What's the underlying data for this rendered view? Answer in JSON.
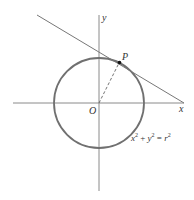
{
  "diagram": {
    "type": "geometry",
    "axes": {
      "x_label": "x",
      "y_label": "y",
      "origin_label": "O"
    },
    "point": {
      "label": "P"
    },
    "equation": {
      "lhs_x": "x",
      "lhs_x_exp": "2",
      "plus": " + ",
      "lhs_y": "y",
      "lhs_y_exp": "2",
      "equals": " = ",
      "rhs_r": "r",
      "rhs_r_exp": "2"
    },
    "colors": {
      "circle": "#707070",
      "axes": "#8a8a8a",
      "tangent": "#777777",
      "radius_dashed": "#666666",
      "point": "#111111",
      "text": "#333333"
    }
  }
}
